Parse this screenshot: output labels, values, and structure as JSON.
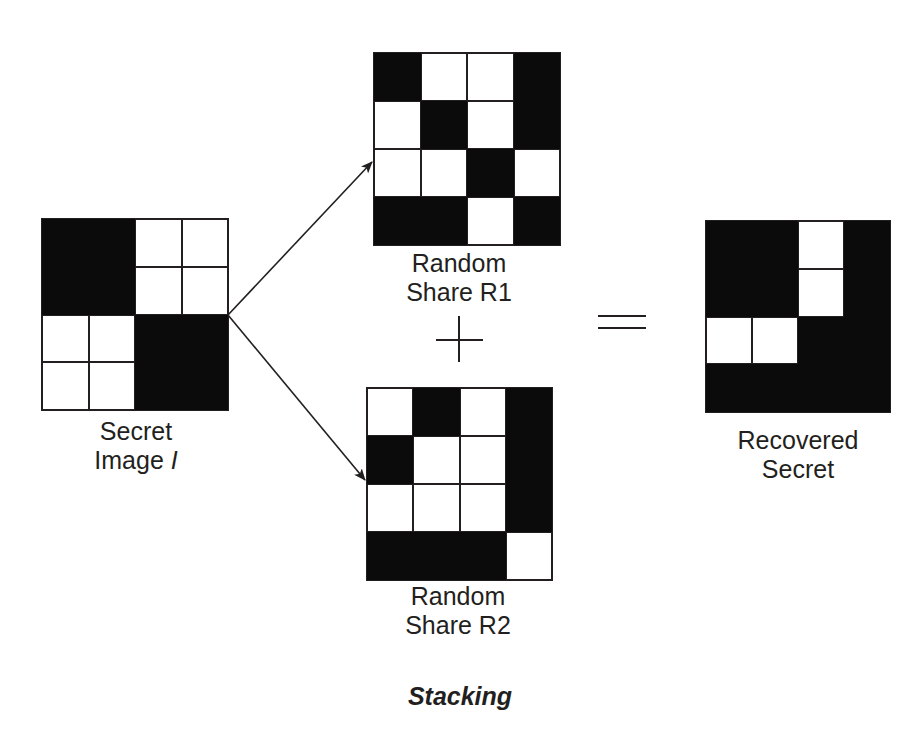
{
  "diagram": {
    "title": "Stacking",
    "colors": {
      "black": "#0b0b0b",
      "white": "#ffffff",
      "line": "#231f20"
    },
    "secret_image": {
      "label_line1": "Secret",
      "label_line2": "Image",
      "label_var": "I",
      "cells": [
        [
          "B",
          "B",
          "W",
          "W"
        ],
        [
          "B",
          "B",
          "W",
          "W"
        ],
        [
          "W",
          "W",
          "B",
          "B"
        ],
        [
          "W",
          "W",
          "B",
          "B"
        ]
      ]
    },
    "share_r1": {
      "label_line1": "Random",
      "label_line2": "Share R1",
      "cells": [
        [
          "B",
          "W",
          "W",
          "B"
        ],
        [
          "W",
          "B",
          "W",
          "B"
        ],
        [
          "W",
          "W",
          "B",
          "W"
        ],
        [
          "B",
          "B",
          "W",
          "B"
        ]
      ]
    },
    "share_r2": {
      "label_line1": "Random",
      "label_line2": "Share R2",
      "cells": [
        [
          "W",
          "B",
          "W",
          "B"
        ],
        [
          "B",
          "W",
          "W",
          "B"
        ],
        [
          "W",
          "W",
          "W",
          "B"
        ],
        [
          "B",
          "B",
          "B",
          "W"
        ]
      ]
    },
    "recovered": {
      "label_line1": "Recovered",
      "label_line2": "Secret",
      "cells": [
        [
          "B",
          "B",
          "W",
          "B"
        ],
        [
          "B",
          "B",
          "W",
          "B"
        ],
        [
          "W",
          "W",
          "B",
          "B"
        ],
        [
          "B",
          "B",
          "B",
          "B"
        ]
      ]
    },
    "operators": {
      "plus": "+",
      "equals": "="
    }
  }
}
